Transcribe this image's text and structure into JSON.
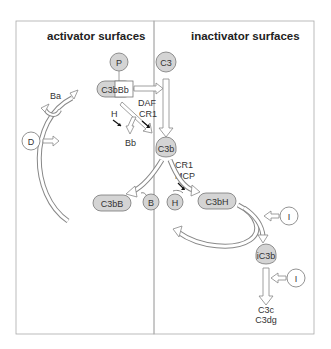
{
  "panels": {
    "left_title": "activator surfaces",
    "right_title": "inactivator surfaces"
  },
  "nodes": {
    "P": "P",
    "C3": "C3",
    "C3bBb": "C3bBb",
    "C3b": "C3b",
    "C3bB": "C3bB",
    "B": "B",
    "H": "H",
    "C3bH": "C3bH",
    "I1": "I",
    "I2": "I",
    "iC3b": "iC3b",
    "D": "D"
  },
  "labels": {
    "Ba": "Ba",
    "Bb": "Bb",
    "DAF": "DAF",
    "CR1_top": "CR1",
    "H_reg": "H",
    "CR1_mid": "CR1",
    "MCP": "MCP",
    "C3c": "C3c",
    "C3dg": "C3dg"
  },
  "colors": {
    "node_fill": "#d4d4d4",
    "border": "#999999",
    "text": "#333333"
  }
}
